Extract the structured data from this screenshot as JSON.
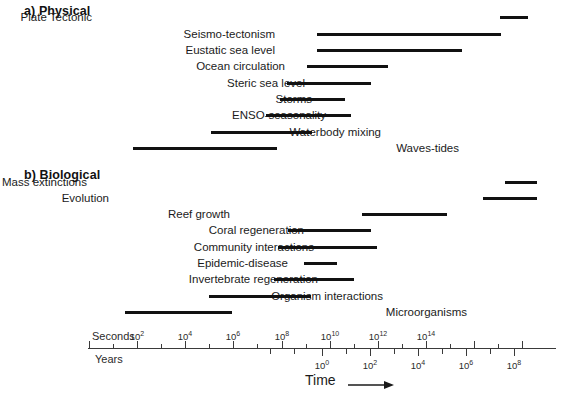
{
  "figure": {
    "axis_title": "Time",
    "arrow_icon": "right-arrow-icon",
    "unit_top": "Seconds",
    "unit_bottom": "Years",
    "bar_color": "#111111",
    "axis_color": "#3a3a3a"
  },
  "panels": [
    {
      "id": "physical",
      "title": "a) Physical",
      "rows": [
        {
          "label": "Plate Tectonic",
          "bar_start_px": 500,
          "bar_end_px": 528,
          "label_right_px": 92,
          "top_px": 9
        },
        {
          "label": "Seismo-tectonism",
          "bar_start_px": 317,
          "bar_end_px": 501,
          "label_right_px": 275,
          "top_px": 26
        },
        {
          "label": "Eustatic sea level",
          "bar_start_px": 317,
          "bar_end_px": 462,
          "label_right_px": 275,
          "top_px": 42
        },
        {
          "label": "Ocean circulation",
          "bar_start_px": 307,
          "bar_end_px": 388,
          "label_right_px": 285,
          "top_px": 58
        },
        {
          "label": "Steric sea level",
          "bar_start_px": 287,
          "bar_end_px": 371,
          "label_right_px": 305,
          "top_px": 75
        },
        {
          "label": "Storms",
          "bar_start_px": 280,
          "bar_end_px": 345,
          "label_right_px": 312,
          "top_px": 91
        },
        {
          "label": "ENSO-seasonality",
          "bar_start_px": 266,
          "bar_end_px": 351,
          "label_right_px": 326,
          "top_px": 107
        },
        {
          "label": "Waterbody mixing",
          "bar_start_px": 211,
          "bar_end_px": 312,
          "label_right_px": 381,
          "top_px": 124
        },
        {
          "label": "Waves-tides",
          "bar_start_px": 133,
          "bar_end_px": 277,
          "label_right_px": 459,
          "top_px": 140
        }
      ]
    },
    {
      "id": "biological",
      "title": "b) Biological",
      "rows": [
        {
          "label": "Mass extinctions",
          "bar_start_px": 505,
          "bar_end_px": 537,
          "label_right_px": 87,
          "top_px": 174
        },
        {
          "label": "Evolution",
          "bar_start_px": 483,
          "bar_end_px": 537,
          "label_right_px": 109,
          "top_px": 190
        },
        {
          "label": "Reef growth",
          "bar_start_px": 362,
          "bar_end_px": 447,
          "label_right_px": 230,
          "top_px": 206
        },
        {
          "label": "Coral regeneration",
          "bar_start_px": 288,
          "bar_end_px": 371,
          "label_right_px": 304,
          "top_px": 222
        },
        {
          "label": "Community interactions",
          "bar_start_px": 278,
          "bar_end_px": 377,
          "label_right_px": 314,
          "top_px": 239
        },
        {
          "label": "Epidemic-disease",
          "bar_start_px": 304,
          "bar_end_px": 337,
          "label_right_px": 288,
          "top_px": 255
        },
        {
          "label": "Invertebrate regeneration",
          "bar_start_px": 274,
          "bar_end_px": 354,
          "label_right_px": 318,
          "top_px": 271
        },
        {
          "label": "Organism interactions",
          "bar_start_px": 209,
          "bar_end_px": 311,
          "label_right_px": 383,
          "top_px": 288
        },
        {
          "label": "Microorganisms",
          "bar_start_px": 125,
          "bar_end_px": 232,
          "label_right_px": 467,
          "top_px": 304
        }
      ]
    }
  ],
  "axis": {
    "line_start_px": 88,
    "line_end_px": 556,
    "y_px": 348,
    "px_per_decade": 24.1,
    "seconds_ticks": [
      {
        "exp": "0",
        "x_px": 89,
        "labeled": false,
        "major": true
      },
      {
        "exp": "1",
        "x_px": 113,
        "labeled": false,
        "major": false
      },
      {
        "exp": "2",
        "x_px": 137,
        "labeled": true,
        "major": true,
        "text": "10",
        "sup": "2"
      },
      {
        "exp": "3",
        "x_px": 161,
        "labeled": false,
        "major": false
      },
      {
        "exp": "4",
        "x_px": 185,
        "labeled": true,
        "major": true,
        "text": "10",
        "sup": "4"
      },
      {
        "exp": "5",
        "x_px": 209,
        "labeled": false,
        "major": false
      },
      {
        "exp": "6",
        "x_px": 233,
        "labeled": true,
        "major": true,
        "text": "10",
        "sup": "6"
      },
      {
        "exp": "7",
        "x_px": 257,
        "labeled": false,
        "major": false
      },
      {
        "exp": "8",
        "x_px": 282,
        "labeled": true,
        "major": true,
        "text": "10",
        "sup": "8"
      },
      {
        "exp": "9",
        "x_px": 306,
        "labeled": false,
        "major": false
      },
      {
        "exp": "10",
        "x_px": 330,
        "labeled": true,
        "major": true,
        "text": "10",
        "sup": "10"
      },
      {
        "exp": "11",
        "x_px": 354,
        "labeled": false,
        "major": false
      },
      {
        "exp": "12",
        "x_px": 378,
        "labeled": true,
        "major": true,
        "text": "10",
        "sup": "12"
      },
      {
        "exp": "13",
        "x_px": 402,
        "labeled": false,
        "major": false
      },
      {
        "exp": "14",
        "x_px": 426,
        "labeled": true,
        "major": true,
        "text": "10",
        "sup": "14"
      },
      {
        "exp": "15",
        "x_px": 450,
        "labeled": false,
        "major": false
      },
      {
        "exp": "16",
        "x_px": 474,
        "labeled": false,
        "major": true
      },
      {
        "exp": "17",
        "x_px": 498,
        "labeled": false,
        "major": false
      },
      {
        "exp": "18",
        "x_px": 522,
        "labeled": false,
        "major": true
      }
    ],
    "years_ticks": [
      {
        "exp": "0",
        "x_px": 270,
        "labeled": false,
        "major": false
      },
      {
        "exp": "0",
        "x_px": 294,
        "labeled": false,
        "major": false
      },
      {
        "exp": "0",
        "x_px": 322,
        "labeled": true,
        "major": true,
        "text": "10",
        "sup": "0"
      },
      {
        "exp": "1",
        "x_px": 346,
        "labeled": false,
        "major": false
      },
      {
        "exp": "2",
        "x_px": 370,
        "labeled": true,
        "major": true,
        "text": "10",
        "sup": "2"
      },
      {
        "exp": "3",
        "x_px": 394,
        "labeled": false,
        "major": false
      },
      {
        "exp": "4",
        "x_px": 418,
        "labeled": true,
        "major": true,
        "text": "10",
        "sup": "4"
      },
      {
        "exp": "5",
        "x_px": 442,
        "labeled": false,
        "major": false
      },
      {
        "exp": "6",
        "x_px": 466,
        "labeled": true,
        "major": true,
        "text": "10",
        "sup": "6"
      },
      {
        "exp": "7",
        "x_px": 490,
        "labeled": false,
        "major": false
      },
      {
        "exp": "8",
        "x_px": 514,
        "labeled": true,
        "major": true,
        "text": "10",
        "sup": "8"
      }
    ],
    "unit_top_x_px": 92,
    "unit_top_y_px": 330,
    "unit_bottom_x_px": 95,
    "unit_bottom_y_px": 353,
    "time_label_x_px": 305,
    "time_label_y_px": 372,
    "arrow_x_px": 348,
    "arrow_y_px": 376,
    "arrow_width_px": 46
  },
  "chart_data": {
    "type": "bar",
    "xlabel": "Time",
    "ylabel": "",
    "x_scale": "log10",
    "x_units_primary": "Seconds",
    "x_units_secondary": "Years",
    "xlim_seconds_exp": [
      0,
      18.8
    ],
    "grid": false,
    "legend": "none",
    "note": "Horizontal bars span the characteristic timescale range of each process; x values are log10(seconds).",
    "series": [
      {
        "name": "a) Physical",
        "bars": [
          {
            "category": "Plate Tectonic",
            "start_log10_s": 17.1,
            "end_log10_s": 18.2
          },
          {
            "category": "Seismo-tectonism",
            "start_log10_s": 9.5,
            "end_log10_s": 17.1
          },
          {
            "category": "Eustatic sea level",
            "start_log10_s": 9.5,
            "end_log10_s": 15.5
          },
          {
            "category": "Ocean circulation",
            "start_log10_s": 9.1,
            "end_log10_s": 12.4
          },
          {
            "category": "Steric sea level",
            "start_log10_s": 8.3,
            "end_log10_s": 11.7
          },
          {
            "category": "Storms",
            "start_log10_s": 8.0,
            "end_log10_s": 10.6
          },
          {
            "category": "ENSO-seasonality",
            "start_log10_s": 7.4,
            "end_log10_s": 10.9
          },
          {
            "category": "Waterbody mixing",
            "start_log10_s": 5.1,
            "end_log10_s": 9.3
          },
          {
            "category": "Waves-tides",
            "start_log10_s": 1.9,
            "end_log10_s": 7.8
          }
        ]
      },
      {
        "name": "b) Biological",
        "bars": [
          {
            "category": "Mass extinctions",
            "start_log10_s": 17.3,
            "end_log10_s": 18.6
          },
          {
            "category": "Evolution",
            "start_log10_s": 16.4,
            "end_log10_s": 18.6
          },
          {
            "category": "Reef growth",
            "start_log10_s": 11.4,
            "end_log10_s": 14.9
          },
          {
            "category": "Coral regeneration",
            "start_log10_s": 8.3,
            "end_log10_s": 11.7
          },
          {
            "category": "Community interactions",
            "start_log10_s": 7.9,
            "end_log10_s": 12.0
          },
          {
            "category": "Epidemic-disease",
            "start_log10_s": 9.0,
            "end_log10_s": 10.3
          },
          {
            "category": "Invertebrate regeneration",
            "start_log10_s": 7.7,
            "end_log10_s": 11.0
          },
          {
            "category": "Organism interactions",
            "start_log10_s": 5.0,
            "end_log10_s": 9.2
          },
          {
            "category": "Microorganisms",
            "start_log10_s": 1.5,
            "end_log10_s": 6.0
          }
        ]
      }
    ]
  }
}
